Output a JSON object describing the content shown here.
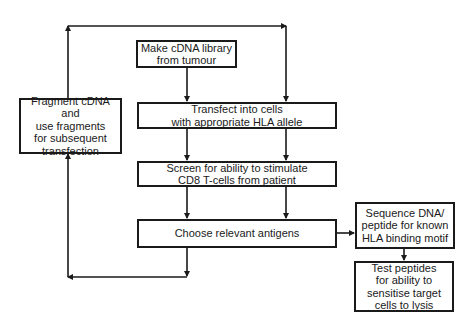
{
  "diagram": {
    "type": "flowchart",
    "nodes": [
      {
        "id": "make_library",
        "label": "Make cDNA library\nfrom tumour"
      },
      {
        "id": "transfect",
        "label": "Transfect into cells\nwith appropriate HLA allele"
      },
      {
        "id": "screen",
        "label": "Screen for ability to stimulate\nCD8 T-cells from patient"
      },
      {
        "id": "choose",
        "label": "Choose relevant antigens"
      },
      {
        "id": "fragment",
        "label": "Fragment cDNA and\nuse fragments\nfor subsequent\ntransfection"
      },
      {
        "id": "sequence",
        "label": "Sequence DNA/\npeptide for known\nHLA binding motif"
      },
      {
        "id": "test",
        "label": "Test peptides\nfor ability to\nsensitise target\ncells to lysis"
      }
    ],
    "edges": [
      {
        "from": "make_library",
        "to": "transfect"
      },
      {
        "from": "transfect",
        "to": "screen"
      },
      {
        "from": "screen",
        "to": "choose"
      },
      {
        "from": "choose",
        "to": "fragment"
      },
      {
        "from": "fragment",
        "to": "transfect"
      },
      {
        "from": "choose",
        "to": "sequence"
      },
      {
        "from": "sequence",
        "to": "test"
      }
    ],
    "colors": {
      "line": "#1a1a1a",
      "background": "#ffffff"
    }
  }
}
